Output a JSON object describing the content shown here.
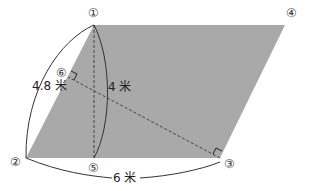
{
  "diagram": {
    "type": "parallelogram-geometry",
    "fill_color": "#a9a9a9",
    "stroke_color": "#333333",
    "points": {
      "p1": {
        "label": "①",
        "x": 94,
        "y": 25
      },
      "p2": {
        "label": "②",
        "x": 26,
        "y": 158
      },
      "p3": {
        "label": "③",
        "x": 220,
        "y": 158
      },
      "p4": {
        "label": "④",
        "x": 285,
        "y": 25
      },
      "p5": {
        "label": "⑤",
        "x": 94,
        "y": 158
      },
      "p6": {
        "label": "⑥",
        "x": 68,
        "y": 77
      }
    },
    "dimensions": {
      "slant_side": "4.8 米",
      "height": "4 米",
      "base": "6 米"
    }
  }
}
